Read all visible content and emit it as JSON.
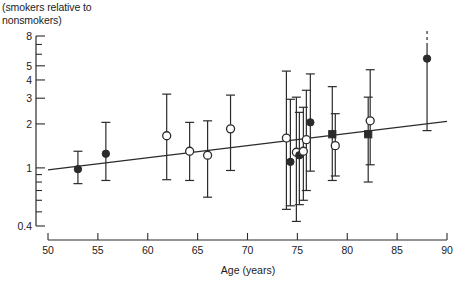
{
  "header": {
    "title_line1": "(smokers relative to",
    "title_line2": "nonsmokers)"
  },
  "axis_labels": {
    "x_label": "Age (years)",
    "y_label": ""
  },
  "chart_data": {
    "type": "scatter",
    "title": "(smokers relative to nonsmokers)",
    "xlabel": "Age (years)",
    "ylabel": "(smokers relative to nonsmokers)",
    "yscale": "log",
    "xlim": [
      50,
      90
    ],
    "ylim": [
      0.4,
      8
    ],
    "grid": false,
    "legend": null,
    "xticks": [
      50,
      55,
      60,
      65,
      70,
      75,
      80,
      85,
      90
    ],
    "xticklabels": [
      "50",
      "55",
      "60",
      "65",
      "70",
      "75",
      "80",
      "85",
      "90"
    ],
    "yticks": [
      0.4,
      0.5,
      0.6,
      0.7,
      0.8,
      0.9,
      1,
      1.5,
      2,
      3,
      4,
      5,
      6,
      7,
      8
    ],
    "yticklabels": [
      "0.4",
      "",
      "",
      "",
      "",
      "",
      "1",
      "",
      "2",
      "3",
      "4",
      "5",
      "",
      "",
      "8"
    ],
    "labeled_yticks": [
      {
        "value": 8,
        "label": "8"
      },
      {
        "value": 5,
        "label": "5"
      },
      {
        "value": 4,
        "label": "4"
      },
      {
        "value": 3,
        "label": "3"
      },
      {
        "value": 2,
        "label": "2"
      },
      {
        "value": 1,
        "label": "1"
      },
      {
        "value": 0.4,
        "label": "0.4"
      }
    ],
    "markers": {
      "open-circle": "open circle",
      "filled-circle": "filled circle",
      "filled-square": "filled square"
    },
    "points": [
      {
        "x": 53.0,
        "y": 0.98,
        "lo": 0.78,
        "hi": 1.3,
        "marker": "filled-circle",
        "dashed_hi": false
      },
      {
        "x": 55.8,
        "y": 1.25,
        "lo": 0.82,
        "hi": 2.05,
        "marker": "filled-circle",
        "dashed_hi": false
      },
      {
        "x": 61.9,
        "y": 1.66,
        "lo": 0.83,
        "hi": 3.2,
        "marker": "open-circle",
        "dashed_hi": false
      },
      {
        "x": 64.2,
        "y": 1.3,
        "lo": 0.82,
        "hi": 2.05,
        "marker": "open-circle",
        "dashed_hi": false
      },
      {
        "x": 66.0,
        "y": 1.22,
        "lo": 0.63,
        "hi": 2.1,
        "marker": "open-circle",
        "dashed_hi": false
      },
      {
        "x": 68.3,
        "y": 1.85,
        "lo": 0.96,
        "hi": 3.15,
        "marker": "open-circle",
        "dashed_hi": false
      },
      {
        "x": 73.9,
        "y": 1.6,
        "lo": 0.52,
        "hi": 4.6,
        "marker": "open-circle",
        "dashed_hi": false
      },
      {
        "x": 74.3,
        "y": 1.1,
        "lo": 0.55,
        "hi": 2.95,
        "marker": "filled-circle",
        "dashed_hi": false
      },
      {
        "x": 74.9,
        "y": 1.28,
        "lo": 0.43,
        "hi": 3.05,
        "marker": "open-circle",
        "dashed_hi": false
      },
      {
        "x": 75.2,
        "y": 1.22,
        "lo": 0.56,
        "hi": 2.4,
        "marker": "filled-circle",
        "dashed_hi": false
      },
      {
        "x": 75.6,
        "y": 1.3,
        "lo": 0.6,
        "hi": 2.6,
        "marker": "open-circle",
        "dashed_hi": false
      },
      {
        "x": 75.9,
        "y": 1.56,
        "lo": 0.7,
        "hi": 3.4,
        "marker": "open-circle",
        "dashed_hi": false
      },
      {
        "x": 76.3,
        "y": 2.05,
        "lo": 0.95,
        "hi": 4.4,
        "marker": "filled-circle",
        "dashed_hi": false
      },
      {
        "x": 78.5,
        "y": 1.7,
        "lo": 0.82,
        "hi": 3.6,
        "marker": "filled-square",
        "dashed_hi": false
      },
      {
        "x": 78.8,
        "y": 1.42,
        "lo": 0.88,
        "hi": 2.35,
        "marker": "open-circle",
        "dashed_hi": false
      },
      {
        "x": 82.1,
        "y": 1.7,
        "lo": 0.8,
        "hi": 3.05,
        "marker": "filled-square",
        "dashed_hi": false
      },
      {
        "x": 82.3,
        "y": 2.1,
        "lo": 1.05,
        "hi": 4.7,
        "marker": "open-circle",
        "dashed_hi": false
      },
      {
        "x": 88.0,
        "y": 5.6,
        "lo": 1.8,
        "hi": 9.0,
        "marker": "filled-circle",
        "dashed_hi": true
      }
    ],
    "fit_line": {
      "x1": 50.0,
      "y1": 0.97,
      "x2": 90.0,
      "y2": 2.08,
      "style": "solid"
    },
    "annotations": []
  }
}
